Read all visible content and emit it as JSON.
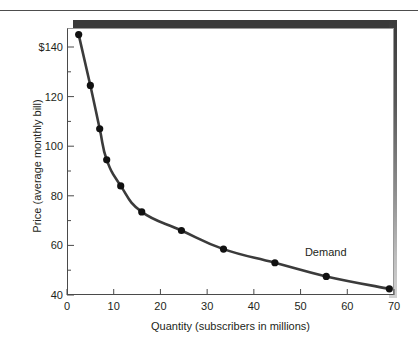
{
  "chart_data": {
    "type": "line",
    "title": "",
    "xlabel": "Quantity (subscribers in millions)",
    "ylabel": "Price (average monthly bill)",
    "xlim": [
      0,
      70
    ],
    "ylim": [
      40,
      150
    ],
    "grid": false,
    "legend_position": "inline-annotation",
    "series": [
      {
        "name": "Demand",
        "x": [
          2.5,
          5.0,
          7.0,
          8.5,
          11.5,
          16.0,
          24.5,
          33.5,
          44.5,
          55.5,
          69.0
        ],
        "y": [
          145,
          124.5,
          107,
          94.5,
          84,
          73.5,
          66,
          58.5,
          53,
          47.5,
          42.5
        ]
      }
    ],
    "annotations": [
      {
        "text": "Demand",
        "x": 56.5,
        "y": 57
      }
    ],
    "x_ticks": [
      {
        "value": 0,
        "label": "0"
      },
      {
        "value": 10,
        "label": "10"
      },
      {
        "value": 20,
        "label": "20"
      },
      {
        "value": 30,
        "label": "30"
      },
      {
        "value": 40,
        "label": "40"
      },
      {
        "value": 50,
        "label": "50"
      },
      {
        "value": 60,
        "label": "60"
      },
      {
        "value": 70,
        "label": "70"
      }
    ],
    "y_ticks": [
      {
        "value": 40,
        "label": "40"
      },
      {
        "value": 60,
        "label": "60"
      },
      {
        "value": 80,
        "label": "80"
      },
      {
        "value": 100,
        "label": "100"
      },
      {
        "value": 120,
        "label": "120"
      },
      {
        "value": 140,
        "label": "$140"
      }
    ],
    "y_minor_ticks": [
      50,
      70,
      90,
      110,
      130
    ],
    "colors": {
      "curve": "#3b3b3b",
      "marker": "#111111",
      "axis": "#4a4a4a",
      "text": "#231f20",
      "shadow_dark": "#3a3a3a",
      "shadow_light": "#d2d2d2",
      "background": "#ffffff"
    }
  }
}
